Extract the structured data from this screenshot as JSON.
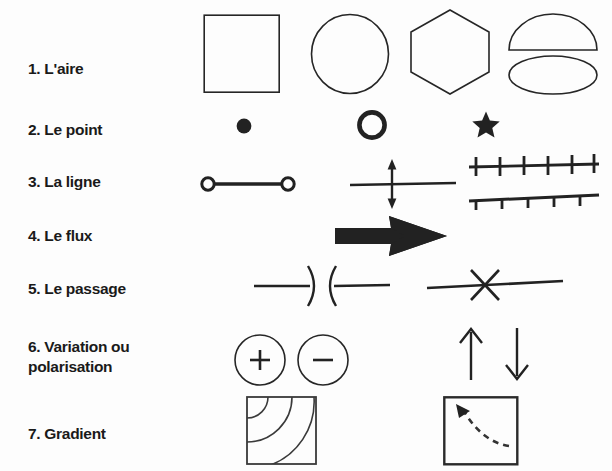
{
  "document": {
    "type": "cartographic-symbology-legend",
    "background_color": "#fdfdfd",
    "ink_color": "#262626",
    "fill_color": "#222222"
  },
  "rows": [
    {
      "number": "1.",
      "label": "1. L'aire",
      "label_line2": "",
      "symbols": [
        {
          "name": "square-outline",
          "kind": "square"
        },
        {
          "name": "circle-outline",
          "kind": "circle"
        },
        {
          "name": "hexagon-outline",
          "kind": "hexagon"
        },
        {
          "name": "dome-over-ellipse",
          "kind": "dome-ellipse"
        }
      ]
    },
    {
      "number": "2.",
      "label": "2. Le point",
      "label_line2": "",
      "symbols": [
        {
          "name": "filled-dot",
          "kind": "dot"
        },
        {
          "name": "ring-outline",
          "kind": "ring"
        },
        {
          "name": "filled-star",
          "kind": "star"
        }
      ]
    },
    {
      "number": "3.",
      "label": "3. La ligne",
      "label_line2": "",
      "symbols": [
        {
          "name": "line-with-end-nodes",
          "kind": "line-nodes"
        },
        {
          "name": "line-with-double-arrow-crossing",
          "kind": "line-cross-arrow"
        },
        {
          "name": "line-with-cross-ticks",
          "kind": "line-cross-ticks",
          "tick_count": 6
        },
        {
          "name": "line-with-down-ticks",
          "kind": "line-down-ticks",
          "tick_count": 5
        }
      ]
    },
    {
      "number": "4.",
      "label": "4. Le flux",
      "label_line2": "",
      "symbols": [
        {
          "name": "thick-flow-arrow",
          "kind": "flow-arrow"
        }
      ]
    },
    {
      "number": "5.",
      "label": "5. Le passage",
      "label_line2": "",
      "symbols": [
        {
          "name": "line-with-facing-brackets",
          "kind": "gate-brackets"
        },
        {
          "name": "line-with-x-barrier",
          "kind": "x-barrier"
        }
      ]
    },
    {
      "number": "6.",
      "label": "6. Variation ou",
      "label_line2": "polarisation",
      "symbols": [
        {
          "name": "circle-plus",
          "kind": "circle-sign",
          "sign": "+"
        },
        {
          "name": "circle-minus",
          "kind": "circle-sign",
          "sign": "–"
        },
        {
          "name": "arrow-up",
          "kind": "arrow-up"
        },
        {
          "name": "arrow-down",
          "kind": "arrow-down"
        }
      ]
    },
    {
      "number": "7.",
      "label": "7. Gradient",
      "label_line2": "",
      "symbols": [
        {
          "name": "square-with-isoline-arcs",
          "kind": "gradient-arcs",
          "arc_count": 3
        },
        {
          "name": "square-with-dashed-gradient-arrow",
          "kind": "gradient-arrow"
        }
      ]
    }
  ]
}
